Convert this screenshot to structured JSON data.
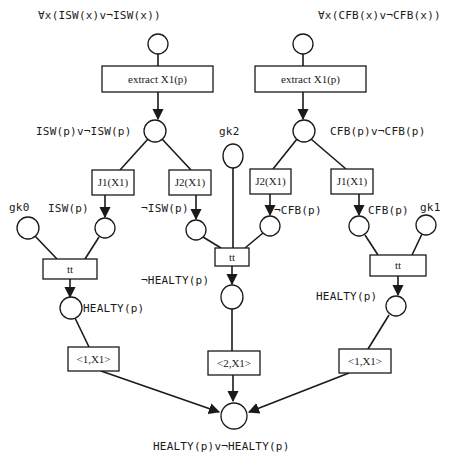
{
  "diagram": {
    "type": "petri-net",
    "places": {
      "top_left": {
        "label": "∀x(ISW(x)v¬ISW(x))"
      },
      "top_right": {
        "label": "∀x(CFB(x)v¬CFB(x))"
      },
      "isw_or": {
        "label": "ISW(p)v¬ISW(p)"
      },
      "cfb_or": {
        "label": "CFB(p)v¬CFB(p)"
      },
      "gk0": {
        "label": "gk0"
      },
      "gk1": {
        "label": "gk1"
      },
      "gk2": {
        "label": "gk2"
      },
      "isw": {
        "label": "ISW(p)"
      },
      "not_isw": {
        "label": "¬ISW(p)"
      },
      "not_cfb": {
        "label": "¬CFB(p)"
      },
      "cfb": {
        "label": "CFB(p)"
      },
      "healty_left": {
        "label": "HEALTY(p)"
      },
      "not_healty": {
        "label": "¬HEALTY(p)"
      },
      "healty_right": {
        "label": "HEALTY(p)"
      },
      "final": {
        "label": "HEALTY(p)v¬HEALTY(p)"
      }
    },
    "transitions": {
      "extract_left": {
        "label": "extract X1(p)"
      },
      "extract_right": {
        "label": "extract X1(p)"
      },
      "j1_left": {
        "label": "J1(X1)"
      },
      "j2_left": {
        "label": "J2(X1)"
      },
      "j2_right": {
        "label": "J2(X1)"
      },
      "j1_right": {
        "label": "J1(X1)"
      },
      "tt_left": {
        "label": "tt"
      },
      "tt_center": {
        "label": "tt"
      },
      "tt_right": {
        "label": "tt"
      },
      "out_left": {
        "label": "<1,X1>"
      },
      "out_center": {
        "label": "<2,X1>"
      },
      "out_right": {
        "label": "<1,X1>"
      }
    }
  }
}
